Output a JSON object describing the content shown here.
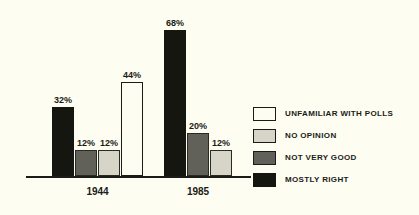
{
  "chart_data": {
    "type": "bar",
    "title": "",
    "subtitle": "",
    "xlabel": "",
    "ylabel": "",
    "ylim": [
      0,
      75
    ],
    "grid": false,
    "legend_position": "right",
    "categories": [
      "1944",
      "1985"
    ],
    "series": [
      {
        "name": "MOSTLY RIGHT",
        "color": "#161610",
        "values": [
          32,
          68
        ]
      },
      {
        "name": "NOT VERY GOOD",
        "color": "#626159",
        "values": [
          12,
          20
        ]
      },
      {
        "name": "NO OPINION",
        "color": "#d6d5c7",
        "values": [
          12,
          12
        ]
      },
      {
        "name": "UNFAMILIAR WITH POLLS",
        "color": "#fdfdf2",
        "values": [
          44,
          null
        ]
      }
    ],
    "groups": [
      {
        "label": "1944",
        "bars": [
          {
            "series": "MOSTLY RIGHT",
            "value": 32,
            "label": "32%",
            "style": "mostly-right"
          },
          {
            "series": "NOT VERY GOOD",
            "value": 12,
            "label": "12%",
            "style": "not-very-good"
          },
          {
            "series": "NO OPINION",
            "value": 12,
            "label": "12%",
            "style": "no-opinion"
          },
          {
            "series": "UNFAMILIAR WITH POLLS",
            "value": 44,
            "label": "44%",
            "style": "unfamiliar"
          }
        ]
      },
      {
        "label": "1985",
        "bars": [
          {
            "series": "MOSTLY RIGHT",
            "value": 68,
            "label": "68%",
            "style": "mostly-right"
          },
          {
            "series": "NOT VERY GOOD",
            "value": 20,
            "label": "20%",
            "style": "not-very-good"
          },
          {
            "series": "NO OPINION",
            "value": 12,
            "label": "12%",
            "style": "no-opinion"
          }
        ]
      }
    ]
  },
  "legend": {
    "items": [
      {
        "label": "UNFAMILIAR WITH POLLS",
        "swatch": "sw-unfamiliar",
        "color": "#fdfdf2"
      },
      {
        "label": "NO OPINION",
        "swatch": "sw-no-opinion",
        "color": "#d6d5c7"
      },
      {
        "label": "NOT VERY GOOD",
        "swatch": "sw-not-very-good",
        "color": "#626159"
      },
      {
        "label": "MOSTLY RIGHT",
        "swatch": "sw-mostly-right",
        "color": "#161610"
      }
    ]
  },
  "axis": {
    "group_labels": [
      "1944",
      "1985"
    ]
  },
  "colors": {
    "background": "#fdfdf2",
    "ink": "#1b1b17"
  }
}
